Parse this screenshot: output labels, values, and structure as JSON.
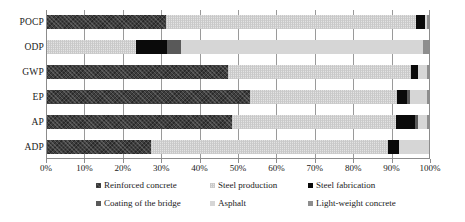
{
  "chart_data": {
    "type": "bar",
    "subtype": "stacked-100-percent-horizontal",
    "title": "",
    "xlabel": "",
    "ylabel": "",
    "xlim": [
      0,
      100
    ],
    "grid": true,
    "grid_axis": "x",
    "legend_position": "bottom",
    "orientation": "horizontal",
    "categories": [
      "POCP",
      "ODP",
      "GWP",
      "EP",
      "AP",
      "ADP"
    ],
    "tick_labels": [
      "0%",
      "10%",
      "20%",
      "30%",
      "40%",
      "50%",
      "60%",
      "70%",
      "80%",
      "90%",
      "100%"
    ],
    "tick_values": [
      0,
      10,
      20,
      30,
      40,
      50,
      60,
      70,
      80,
      90,
      100
    ],
    "series": [
      {
        "name": "Reinforced concrete",
        "key": "reinforced-concrete",
        "color": "#3e3e3e",
        "values": [
          31.2,
          0.0,
          47.4,
          53.1,
          48.5,
          27.4
        ]
      },
      {
        "name": "Steel production",
        "key": "steel-production",
        "color": "#e3e3e3",
        "values": [
          65.1,
          23.5,
          47.7,
          38.4,
          42.6,
          61.6
        ]
      },
      {
        "name": "Steel fabrication",
        "key": "steel-fabrication",
        "color": "#0a0a0a",
        "values": [
          2.3,
          8.0,
          1.7,
          2.6,
          5.0,
          2.9
        ]
      },
      {
        "name": "Coating of the bridge",
        "key": "coating-of-the-bridge",
        "color": "#595959",
        "values": [
          0.0,
          3.6,
          0.0,
          0.6,
          0.9,
          0.0
        ]
      },
      {
        "name": "Asphalt",
        "key": "asphalt",
        "color": "#d6d6d6",
        "values": [
          0.6,
          63.1,
          2.4,
          4.4,
          2.2,
          8.1
        ]
      },
      {
        "name": "Light-weight concrete",
        "key": "light-weight-concrete",
        "color": "#8e8e8e",
        "values": [
          0.8,
          1.8,
          0.8,
          0.9,
          0.8,
          0.0
        ]
      }
    ]
  },
  "legend": {
    "rows": [
      [
        {
          "label": "Reinforced concrete",
          "key": "reinforced-concrete",
          "left": 0
        },
        {
          "label": "Steel production",
          "key": "steel-production",
          "left": 114
        },
        {
          "label": "Steel fabrication",
          "key": "steel-fabrication",
          "left": 212
        }
      ],
      [
        {
          "label": "Coating of the bridge",
          "key": "coating-of-the-bridge",
          "left": 0
        },
        {
          "label": "Asphalt",
          "key": "asphalt",
          "left": 114
        },
        {
          "label": "Light-weight concrete",
          "key": "light-weight-concrete",
          "left": 212
        }
      ]
    ]
  }
}
